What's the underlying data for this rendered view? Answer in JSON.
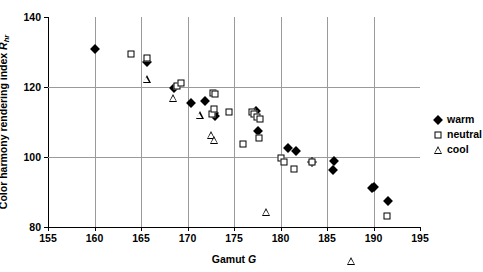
{
  "figure": {
    "top_sliver_text": "",
    "background": "#ffffff",
    "marker_color": "#000000",
    "gridline_color": "#9a9a9a"
  },
  "chart_data": {
    "type": "scatter",
    "title": "",
    "xlabel": "Gamut G",
    "xlabel_plain": "Gamut",
    "xlabel_italic": "G",
    "ylabel": "Color harmony rendering index Rhr",
    "ylabel_plain": "Color harmony rendering index",
    "ylabel_italic": "R",
    "ylabel_sub": "hr",
    "xlim": [
      155,
      195
    ],
    "ylim": [
      80,
      140
    ],
    "xticks": [
      155,
      160,
      165,
      170,
      175,
      180,
      185,
      190,
      195
    ],
    "yticks": [
      80,
      100,
      120,
      140
    ],
    "grid": true,
    "grid_axes": "both",
    "legend_position": "right",
    "series": [
      {
        "name": "warm",
        "marker": "filled-diamond",
        "color": "#000000",
        "points": [
          [
            160.0,
            130.8
          ],
          [
            165.6,
            127.2
          ],
          [
            168.6,
            119.6
          ],
          [
            170.4,
            115.3
          ],
          [
            171.9,
            115.9
          ],
          [
            172.9,
            112.5
          ],
          [
            173.0,
            111.6
          ],
          [
            177.4,
            113.1
          ],
          [
            177.6,
            107.5
          ],
          [
            180.8,
            102.7
          ],
          [
            181.7,
            101.8
          ],
          [
            183.4,
            98.6
          ],
          [
            185.7,
            99.0
          ],
          [
            185.6,
            96.2
          ],
          [
            189.8,
            91.2
          ],
          [
            190.1,
            91.5
          ],
          [
            191.6,
            87.3
          ]
        ]
      },
      {
        "name": "neutral",
        "marker": "open-square",
        "color": "#000000",
        "points": [
          [
            163.9,
            129.3
          ],
          [
            165.6,
            128.3
          ],
          [
            168.9,
            120.4
          ],
          [
            169.3,
            121.1
          ],
          [
            172.7,
            118.3
          ],
          [
            173.0,
            118.1
          ],
          [
            172.6,
            112.2
          ],
          [
            172.9,
            113.7
          ],
          [
            174.5,
            112.9
          ],
          [
            176.0,
            103.8
          ],
          [
            176.9,
            112.9
          ],
          [
            177.1,
            112.3
          ],
          [
            177.5,
            111.3
          ],
          [
            177.8,
            110.8
          ],
          [
            177.7,
            105.4
          ],
          [
            180.0,
            99.6
          ],
          [
            180.4,
            98.6
          ],
          [
            181.5,
            96.7
          ],
          [
            183.4,
            98.6
          ],
          [
            191.5,
            83.1
          ]
        ]
      },
      {
        "name": "cool",
        "marker": "open-triangle",
        "color": "#000000",
        "points": [
          [
            165.6,
            122.4
          ],
          [
            168.4,
            119.2
          ],
          [
            171.3,
            116.6
          ],
          [
            172.5,
            113.2
          ],
          [
            172.9,
            114.1
          ],
          [
            178.4,
            95.6
          ],
          [
            187.6,
            83.9
          ]
        ]
      }
    ]
  },
  "legend": {
    "items": [
      {
        "label": "warm",
        "marker": "filled-diamond"
      },
      {
        "label": "neutral",
        "marker": "open-square"
      },
      {
        "label": "cool",
        "marker": "open-triangle"
      }
    ]
  }
}
